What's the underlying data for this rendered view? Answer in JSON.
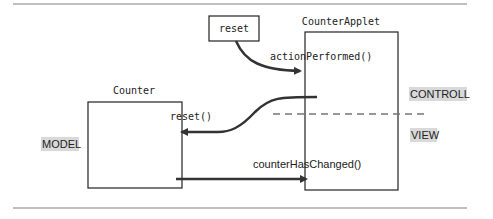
{
  "diagram": {
    "type": "MVC sequence diagram",
    "boxes": {
      "reset_button": {
        "label": "reset"
      },
      "counter_applet": {
        "label": "CounterApplet"
      },
      "counter": {
        "label": "Counter"
      }
    },
    "messages": {
      "action_performed": "actionPerformed()",
      "reset_call": "reset()",
      "counter_has_changed": "counterHasChanged()"
    },
    "layers": {
      "controller": "CONTROLL",
      "view": "VIEW",
      "model": "MODEL"
    },
    "colors": {
      "stroke": "#222222",
      "arrow": "#333333",
      "divider": "#aaaaaa",
      "tag_background": "#d9d9d9"
    }
  }
}
